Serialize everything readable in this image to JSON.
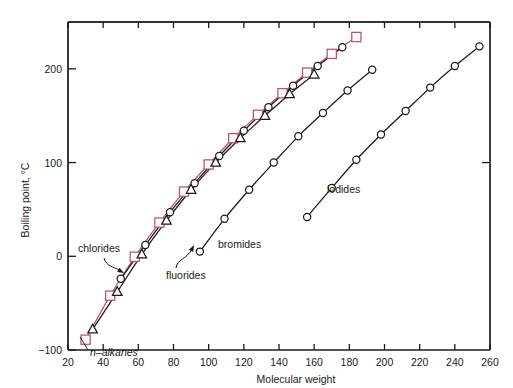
{
  "chart_data": {
    "type": "line",
    "title": "",
    "xlabel": "Molecular weight",
    "ylabel": "Boiling point, °C",
    "xlim": [
      20,
      260
    ],
    "ylim": [
      -100,
      250
    ],
    "xticks": [
      20,
      40,
      60,
      80,
      100,
      120,
      140,
      160,
      180,
      200,
      220,
      240,
      260
    ],
    "xticklabels": [
      "20",
      "40",
      "60",
      "80",
      "100",
      "120",
      "140",
      "160",
      "180",
      "200",
      "220",
      "240",
      "260"
    ],
    "yticks": [
      -100,
      0,
      100,
      200
    ],
    "yticklabels": [
      "−100",
      "0",
      "100",
      "200"
    ],
    "grid": false,
    "legend_position": "inline-annotations",
    "series": [
      {
        "name": "n-alkanes",
        "label": "n–alkanes",
        "color": "#c0506a",
        "marker": "square",
        "points": [
          {
            "x": 30,
            "y": -89
          },
          {
            "x": 44,
            "y": -42
          },
          {
            "x": 58,
            "y": -0.5
          },
          {
            "x": 72,
            "y": 36
          },
          {
            "x": 86,
            "y": 69
          },
          {
            "x": 100,
            "y": 98
          },
          {
            "x": 114,
            "y": 126
          },
          {
            "x": 128,
            "y": 151
          },
          {
            "x": 142,
            "y": 174
          },
          {
            "x": 156,
            "y": 196
          },
          {
            "x": 170,
            "y": 216
          },
          {
            "x": 184,
            "y": 234
          }
        ]
      },
      {
        "name": "fluorides",
        "label": "fluorides",
        "color": "#1a1a1a",
        "marker": "triangle",
        "points": [
          {
            "x": 34,
            "y": -78
          },
          {
            "x": 48,
            "y": -38
          },
          {
            "x": 62,
            "y": 2
          },
          {
            "x": 76,
            "y": 38
          },
          {
            "x": 90,
            "y": 71
          },
          {
            "x": 104,
            "y": 100
          },
          {
            "x": 118,
            "y": 126
          },
          {
            "x": 132,
            "y": 150
          },
          {
            "x": 146,
            "y": 173
          },
          {
            "x": 160,
            "y": 194
          }
        ]
      },
      {
        "name": "chlorides",
        "label": "chlorides",
        "color": "#1a1a1a",
        "marker": "circle",
        "points": [
          {
            "x": 50,
            "y": -24
          },
          {
            "x": 64,
            "y": 12
          },
          {
            "x": 78,
            "y": 47
          },
          {
            "x": 92,
            "y": 78
          },
          {
            "x": 106,
            "y": 107
          },
          {
            "x": 120,
            "y": 134
          },
          {
            "x": 134,
            "y": 159
          },
          {
            "x": 148,
            "y": 182
          },
          {
            "x": 162,
            "y": 203
          },
          {
            "x": 176,
            "y": 223
          }
        ]
      },
      {
        "name": "bromides",
        "label": "bromides",
        "color": "#1a1a1a",
        "marker": "circle",
        "points": [
          {
            "x": 95,
            "y": 5
          },
          {
            "x": 109,
            "y": 40
          },
          {
            "x": 123,
            "y": 71
          },
          {
            "x": 137,
            "y": 100
          },
          {
            "x": 151,
            "y": 128
          },
          {
            "x": 165,
            "y": 153
          },
          {
            "x": 179,
            "y": 177
          },
          {
            "x": 193,
            "y": 199
          }
        ]
      },
      {
        "name": "iodides",
        "label": "iodides",
        "color": "#1a1a1a",
        "marker": "circle",
        "points": [
          {
            "x": 156,
            "y": 42
          },
          {
            "x": 170,
            "y": 73
          },
          {
            "x": 184,
            "y": 103
          },
          {
            "x": 198,
            "y": 130
          },
          {
            "x": 212,
            "y": 155
          },
          {
            "x": 226,
            "y": 180
          },
          {
            "x": 240,
            "y": 203
          },
          {
            "x": 254,
            "y": 224
          }
        ]
      }
    ],
    "annotations": [
      {
        "id": "chlorides",
        "text": "chlorides",
        "kind": "callout-with-arrow"
      },
      {
        "id": "fluorides",
        "text": "fluorides",
        "kind": "callout-with-arrow"
      },
      {
        "id": "n-alkanes",
        "text": "n–alkanes",
        "kind": "inline-label"
      },
      {
        "id": "bromides",
        "text": "bromides",
        "kind": "inline-label"
      },
      {
        "id": "iodides",
        "text": "iodides",
        "kind": "inline-label"
      }
    ],
    "colors": {
      "alkane_accent": "#c0506a",
      "axis": "#1a1a1a",
      "top_border_tint": "#3d7a52",
      "background": "#ffffff"
    }
  }
}
